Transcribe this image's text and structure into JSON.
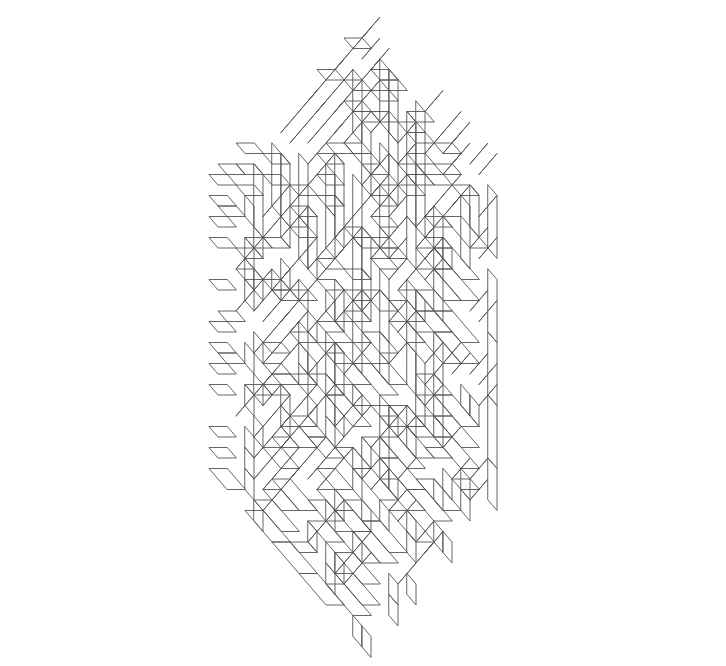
{
  "figure": {
    "title": "Hexagonal lozenge tiling",
    "background_color": "#ffffff",
    "line_color": "#555555",
    "line_width": 0.9,
    "fill_color": "none",
    "caption": ""
  },
  "chart_data": {
    "type": "diagram",
    "subtype": "lozenge-tiling",
    "title": "Hexagonal lozenge tiling",
    "xlabel": "",
    "ylabel": "",
    "grid": false,
    "legend": "none",
    "geometry": {
      "lattice": "triangular",
      "unit_rhombus_width_px": 18,
      "unit_rhombus_height_px": 21,
      "center_x_px": 362,
      "center_y_px": 332,
      "hexagon_radius_units": 14,
      "orientations": 3,
      "orientation_angles_deg": [
        90,
        210,
        330
      ],
      "tile_lengths_units": [
        1,
        2,
        3
      ],
      "bounds_px": {
        "x_min": 33,
        "x_max": 690,
        "y_min": 38,
        "y_max": 625
      },
      "motif_period_units": 3,
      "symmetry": "6-fold rotational (C6) about center"
    },
    "colors": {
      "stroke": "#555555",
      "fill": "#ffffff",
      "background": "#ffffff"
    }
  }
}
